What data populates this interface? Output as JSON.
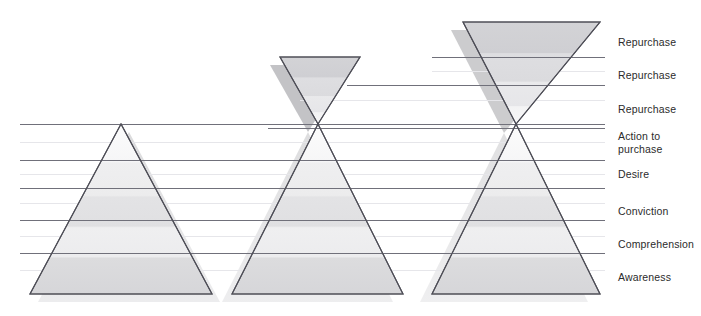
{
  "diagram": {
    "type": "marketing-funnel-hourglass",
    "canvas": {
      "width": 701,
      "height": 316,
      "background": "#ffffff"
    },
    "colors": {
      "outline": "#4a4a52",
      "rule_dark": "#6f6f78",
      "rule_light": "#e2e2e6",
      "shadow": "#d2d2d4",
      "band_light": "#fbfbfb",
      "band_mid": "#ededee",
      "band_dark": "#d8d8da",
      "label_text": "#2b2b2b"
    },
    "stage_labels": [
      {
        "id": "repurchase-3",
        "text": "Repurchase",
        "x": 618,
        "y": 36,
        "rule_y": 57
      },
      {
        "id": "repurchase-2",
        "text": "Repurchase",
        "x": 618,
        "y": 69,
        "rule_y": 85
      },
      {
        "id": "repurchase-1",
        "text": "Repurchase",
        "x": 618,
        "y": 103,
        "rule_y": 128
      },
      {
        "id": "action-to-purchase",
        "text": "Action to\npurchase",
        "x": 618,
        "y": 130,
        "rule_y": 160
      },
      {
        "id": "desire",
        "text": "Desire",
        "x": 618,
        "y": 168,
        "rule_y": 188
      },
      {
        "id": "conviction",
        "text": "Conviction",
        "x": 618,
        "y": 205,
        "rule_y": 220
      },
      {
        "id": "comprehension",
        "text": "Comprehension",
        "x": 618,
        "y": 238,
        "rule_y": 253
      },
      {
        "id": "awareness",
        "text": "Awareness",
        "x": 618,
        "y": 271,
        "rule_y": 294
      }
    ],
    "rules_dark": [
      {
        "id": "rule-57",
        "y": 57,
        "x1": 432,
        "x2": 605
      },
      {
        "id": "rule-85",
        "y": 85,
        "x1": 347,
        "x2": 605
      },
      {
        "id": "rule-128",
        "y": 128,
        "x1": 268,
        "x2": 605
      },
      {
        "id": "rule-160",
        "y": 160,
        "x1": 20,
        "x2": 605
      },
      {
        "id": "rule-188",
        "y": 188,
        "x1": 20,
        "x2": 605
      },
      {
        "id": "rule-220",
        "y": 220,
        "x1": 20,
        "x2": 605
      },
      {
        "id": "rule-253",
        "y": 253,
        "x1": 20,
        "x2": 605
      },
      {
        "id": "rule-124",
        "y": 124,
        "x1": 20,
        "x2": 605
      }
    ],
    "rules_light": [
      {
        "id": "rule-light-71",
        "y": 71,
        "x1": 432,
        "x2": 605
      },
      {
        "id": "rule-light-100",
        "y": 100,
        "x1": 300,
        "x2": 605
      },
      {
        "id": "rule-light-142",
        "y": 142,
        "x1": 20,
        "x2": 605
      },
      {
        "id": "rule-light-174",
        "y": 174,
        "x1": 20,
        "x2": 605
      },
      {
        "id": "rule-light-203",
        "y": 203,
        "x1": 20,
        "x2": 605
      },
      {
        "id": "rule-light-236",
        "y": 236,
        "x1": 20,
        "x2": 605
      },
      {
        "id": "rule-light-270",
        "y": 270,
        "x1": 20,
        "x2": 605
      }
    ],
    "shapes": [
      {
        "id": "pyramid-left",
        "kind": "upright-triangle",
        "apex": {
          "x": 121,
          "y": 124
        },
        "base_left": {
          "x": 30,
          "y": 294
        },
        "base_right": {
          "x": 212,
          "y": 294
        },
        "shadow_offset": {
          "x": 8,
          "y": 8
        },
        "has_inverted_top": false
      },
      {
        "id": "hourglass-middle",
        "kind": "hourglass",
        "waist": {
          "x": 318,
          "y": 124
        },
        "top_left": {
          "x": 280,
          "y": 57
        },
        "top_right": {
          "x": 360,
          "y": 57
        },
        "base_left": {
          "x": 232,
          "y": 294
        },
        "base_right": {
          "x": 403,
          "y": 294
        },
        "shadow_offset": {
          "x": -10,
          "y": 8
        },
        "has_inverted_top": true
      },
      {
        "id": "hourglass-right",
        "kind": "hourglass",
        "waist": {
          "x": 516,
          "y": 124
        },
        "top_left": {
          "x": 463,
          "y": 22
        },
        "top_right": {
          "x": 600,
          "y": 22
        },
        "base_left": {
          "x": 432,
          "y": 294
        },
        "base_right": {
          "x": 600,
          "y": 294
        },
        "shadow_offset": {
          "x": -12,
          "y": 8
        },
        "has_inverted_top": true
      }
    ]
  }
}
